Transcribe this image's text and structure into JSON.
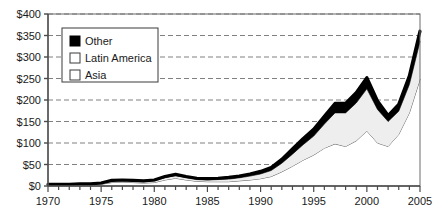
{
  "chart_data": {
    "type": "area",
    "stacked": true,
    "title": "",
    "xlabel": "",
    "ylabel": "",
    "xlim": [
      1970,
      2005
    ],
    "ylim": [
      0,
      400
    ],
    "ytick_values": [
      0,
      50,
      100,
      150,
      200,
      250,
      300,
      350,
      400
    ],
    "ytick_labels": [
      "$0",
      "$50",
      "$100",
      "$150",
      "$200",
      "$250",
      "$300",
      "$350",
      "$400"
    ],
    "xtick_values": [
      1970,
      1971,
      1972,
      1973,
      1974,
      1975,
      1976,
      1977,
      1978,
      1979,
      1980,
      1981,
      1982,
      1983,
      1984,
      1985,
      1986,
      1987,
      1988,
      1989,
      1990,
      1991,
      1992,
      1993,
      1994,
      1995,
      1996,
      1997,
      1998,
      1999,
      2000,
      2001,
      2002,
      2003,
      2004,
      2005
    ],
    "xtick_labels_shown": [
      "1970",
      "1975",
      "1980",
      "1985",
      "1990",
      "1995",
      "2000",
      "2005"
    ],
    "xtick_label_values": [
      1970,
      1975,
      1980,
      1985,
      1990,
      1995,
      2000,
      2005
    ],
    "grid": "horizontal-dashed",
    "legend_position": "upper-left",
    "x": [
      1970,
      1971,
      1972,
      1973,
      1974,
      1975,
      1976,
      1977,
      1978,
      1979,
      1980,
      1981,
      1982,
      1983,
      1984,
      1985,
      1986,
      1987,
      1988,
      1989,
      1990,
      1991,
      1992,
      1993,
      1994,
      1995,
      1996,
      1997,
      1998,
      1999,
      2000,
      2001,
      2002,
      2003,
      2004,
      2005
    ],
    "series": [
      {
        "name": "Asia",
        "color": "#ffffff",
        "stroke": "#4a4a4a",
        "values": [
          2,
          2,
          2,
          3,
          3,
          4,
          8,
          9,
          8,
          7,
          8,
          14,
          18,
          14,
          11,
          10,
          10,
          10,
          12,
          14,
          17,
          22,
          33,
          46,
          60,
          72,
          88,
          98,
          92,
          105,
          128,
          100,
          92,
          120,
          170,
          248
        ]
      },
      {
        "name": "Latin America",
        "color": "#eeeeee",
        "stroke": "#4a4a4a",
        "values": [
          1,
          1,
          1,
          1,
          1,
          2,
          3,
          3,
          3,
          3,
          4,
          5,
          6,
          5,
          4,
          4,
          5,
          6,
          7,
          9,
          11,
          14,
          20,
          28,
          36,
          44,
          56,
          72,
          78,
          88,
          98,
          78,
          58,
          54,
          66,
          88
        ]
      },
      {
        "name": "Other",
        "color": "#000000",
        "stroke": "#000000",
        "values": [
          1,
          1,
          1,
          1,
          1,
          1,
          2,
          2,
          2,
          2,
          2,
          3,
          3,
          3,
          3,
          3,
          3,
          4,
          4,
          5,
          6,
          7,
          9,
          12,
          14,
          16,
          18,
          22,
          22,
          24,
          26,
          20,
          14,
          16,
          20,
          24
        ]
      }
    ],
    "totals": [
      4,
      4,
      4,
      5,
      5,
      7,
      13,
      14,
      13,
      12,
      14,
      22,
      27,
      22,
      18,
      17,
      18,
      20,
      23,
      28,
      34,
      43,
      62,
      86,
      110,
      132,
      162,
      192,
      192,
      217,
      252,
      198,
      164,
      190,
      256,
      360
    ]
  },
  "legend": {
    "items": [
      {
        "label": "Other",
        "swatch": "filled"
      },
      {
        "label": "Latin America",
        "swatch": "outline"
      },
      {
        "label": "Asia",
        "swatch": "outline"
      }
    ]
  },
  "colors": {
    "axis": "#4a4a4a",
    "grid": "#808080",
    "text": "#1a1a1a",
    "band_other": "#000000",
    "band_latin_america": "#eeeeee",
    "band_asia": "#ffffff",
    "plot_border": "#6a6a6a"
  }
}
